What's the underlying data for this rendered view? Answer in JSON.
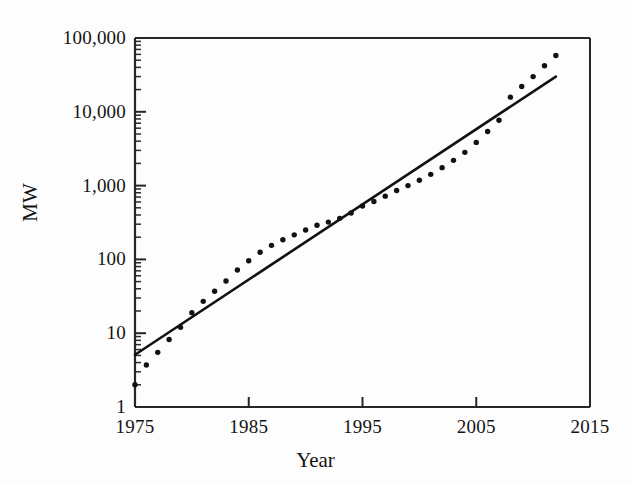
{
  "chart_data": {
    "type": "scatter",
    "title": "",
    "xlabel": "Year",
    "ylabel": "MW",
    "xlim": [
      1975,
      2015
    ],
    "ylim": [
      1,
      100000
    ],
    "yscale": "log",
    "grid": false,
    "legend": null,
    "x_ticks": [
      "1975",
      "1985",
      "1995",
      "2005",
      "2015"
    ],
    "x_tick_values": [
      1975,
      1985,
      1995,
      2005,
      2015
    ],
    "y_ticks": [
      "1",
      "10",
      "100",
      "1,000",
      "10,000",
      "100,000"
    ],
    "y_tick_values": [
      1,
      10,
      100,
      1000,
      10000,
      100000
    ],
    "minor_ticks": true,
    "series": [
      {
        "name": "Installed capacity",
        "type": "scatter",
        "marker": "dot",
        "color": "#111111",
        "x": [
          1975,
          1976,
          1977,
          1978,
          1979,
          1980,
          1981,
          1982,
          1983,
          1984,
          1985,
          1986,
          1987,
          1988,
          1989,
          1990,
          1991,
          1992,
          1993,
          1994,
          1995,
          1996,
          1997,
          1998,
          1999,
          2000,
          2001,
          2002,
          2003,
          2004,
          2005,
          2006,
          2007,
          2008,
          2009,
          2010,
          2011,
          2012
        ],
        "values": [
          2.0,
          3.7,
          5.5,
          8.2,
          12.0,
          19.0,
          27.0,
          37.0,
          51.0,
          72.0,
          96.0,
          125.0,
          155.0,
          185.0,
          215.0,
          250.0,
          290.0,
          320.0,
          360.0,
          425.0,
          530.0,
          610.0,
          720.0,
          860.0,
          1000.0,
          1180.0,
          1420.0,
          1750.0,
          2200.0,
          2820.0,
          3850.0,
          5400.0,
          7700.0,
          15800.0,
          22000.0,
          30000.0,
          42000.0,
          58000.0
        ]
      },
      {
        "name": "Exponential trend line",
        "type": "line",
        "color": "#111111",
        "x": [
          1975,
          2012
        ],
        "values": [
          5.1,
          30000
        ]
      }
    ]
  },
  "axes": {
    "y_title": "MW",
    "x_title": "Year"
  }
}
